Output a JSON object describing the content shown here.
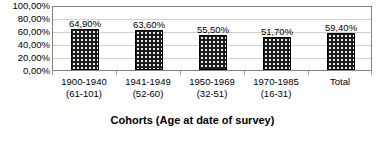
{
  "chart_data": {
    "type": "bar",
    "title": "",
    "subtitle": "",
    "xlabel": "Cohorts (Age at date of survey)",
    "ylabel": "",
    "categories": [
      "1900-1940",
      "1941-1949",
      "1950-1969",
      "1970-1985",
      "Total"
    ],
    "category_sublabels": [
      "(61-101)",
      "(52-60)",
      "(32-51)",
      "(16-31)",
      ""
    ],
    "values": [
      64.9,
      63.6,
      55.5,
      51.7,
      59.4
    ],
    "value_labels": [
      "64,90%",
      "63,60%",
      "55,50%",
      "51,70%",
      "59,40%"
    ],
    "ylim": [
      0,
      100
    ],
    "ytick_values": [
      100,
      80,
      60,
      40,
      20,
      0
    ],
    "ytick_labels": [
      "100,00%",
      "80,00%",
      "60,00%",
      "40,00%",
      "20,00%",
      "0,00%"
    ],
    "grid": true,
    "legend": false,
    "legend_position": "none",
    "series": [
      {
        "name": "",
        "values": [
          64.9,
          63.6,
          55.5,
          51.7,
          59.4
        ]
      }
    ],
    "colors": {
      "bar_fill": "#1c1c1c",
      "bar_pattern_dot": "#e8e8e8",
      "bar_border": "#000000",
      "gridline": "#d0d0d0",
      "plot_border": "#808080",
      "text": "#000000",
      "background": "#ffffff"
    }
  }
}
